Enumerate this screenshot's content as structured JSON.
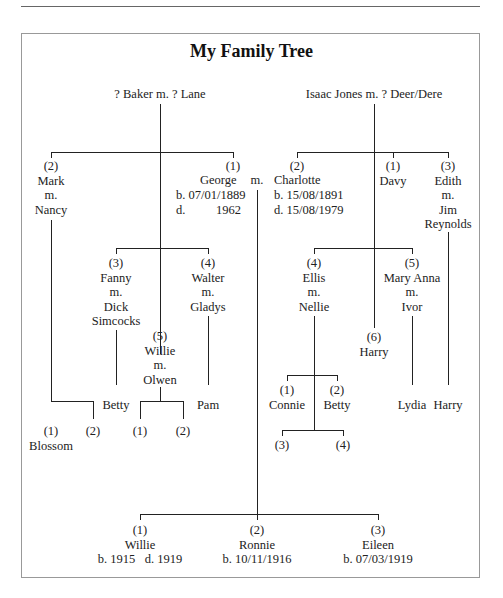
{
  "header": {
    "running_text": "My Family Tree — family relationships"
  },
  "title": "My Family Tree",
  "couples": {
    "baker": "? Baker  m.  ? Lane",
    "jones": "Isaac Jones  m.  ? Deer/Dere"
  },
  "baker_children": {
    "mark": [
      "(2)",
      "Mark",
      "m.",
      "Nancy"
    ],
    "george": {
      "num": "(1)",
      "name": "George",
      "born": "b.  07/01/1889",
      "died_label": "d.",
      "died_year": "1962"
    },
    "marriage": "m.",
    "fanny": [
      "(3)",
      "Fanny",
      "m.",
      "Dick",
      "Simcocks"
    ],
    "walter": [
      "(4)",
      "Walter",
      "m.",
      "Gladys"
    ],
    "willie": [
      "(5)",
      "Willie",
      "m.",
      "Olwen"
    ]
  },
  "jones_children": {
    "charlotte": {
      "num": "(2)",
      "name": "Charlotte",
      "born": "b.  15/08/1891",
      "died": "d.  15/08/1979"
    },
    "davy": [
      "(1)",
      "Davy"
    ],
    "edith": [
      "(3)",
      "Edith",
      "m.",
      "Jim",
      "Reynolds"
    ],
    "ellis": [
      "(4)",
      "Ellis",
      "m.",
      "Nellie"
    ],
    "mary_anna": [
      "(5)",
      "Mary Anna",
      "m.",
      "Ivor"
    ],
    "harry": [
      "(6)",
      "Harry"
    ]
  },
  "grandchildren": {
    "mark_1": [
      "(1)",
      "Blossom"
    ],
    "mark_2": "(2)",
    "fanny_child": "Betty",
    "willie_1": "(1)",
    "willie_2": "(2)",
    "walter_child": "Pam",
    "ellis_1": [
      "(1)",
      "Connie"
    ],
    "ellis_2": [
      "(2)",
      "Betty"
    ],
    "ellis_3": "(3)",
    "ellis_4": "(4)",
    "mary_anna_child": "Lydia",
    "edith_child": "Harry"
  },
  "george_charlotte_children": [
    {
      "num": "(1)",
      "name": "Willie",
      "dates": "b. 1915   d. 1919"
    },
    {
      "num": "(2)",
      "name": "Ronnie",
      "dates": "b. 10/11/1916"
    },
    {
      "num": "(3)",
      "name": "Eileen",
      "dates": "b. 07/03/1919"
    }
  ]
}
